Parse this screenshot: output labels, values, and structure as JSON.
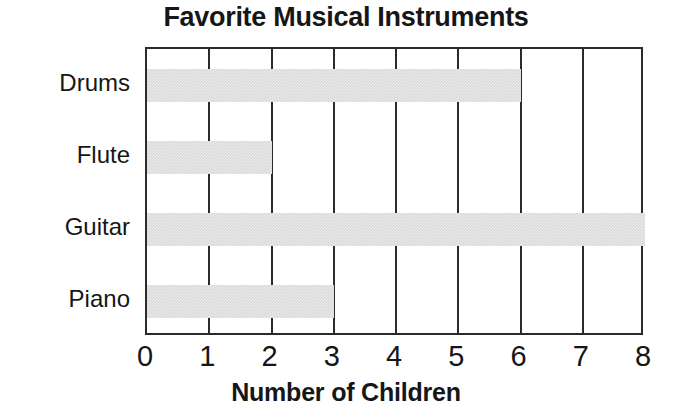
{
  "chart_data": {
    "type": "bar",
    "orientation": "horizontal",
    "title": "Favorite Musical Instruments",
    "xlabel": "Number of Children",
    "ylabel": "",
    "categories": [
      "Drums",
      "Flute",
      "Guitar",
      "Piano"
    ],
    "values": [
      6,
      2,
      8,
      3
    ],
    "xlim": [
      0,
      8
    ],
    "xticks": [
      "0",
      "1",
      "2",
      "3",
      "4",
      "5",
      "6",
      "7",
      "8"
    ],
    "xtick_step": 1,
    "grid": "vertical",
    "legend": null,
    "colors": {
      "bar_fill": "#d9d9d9",
      "axis": "#2b2b2b",
      "text": "#161616",
      "background": "#ffffff"
    }
  }
}
